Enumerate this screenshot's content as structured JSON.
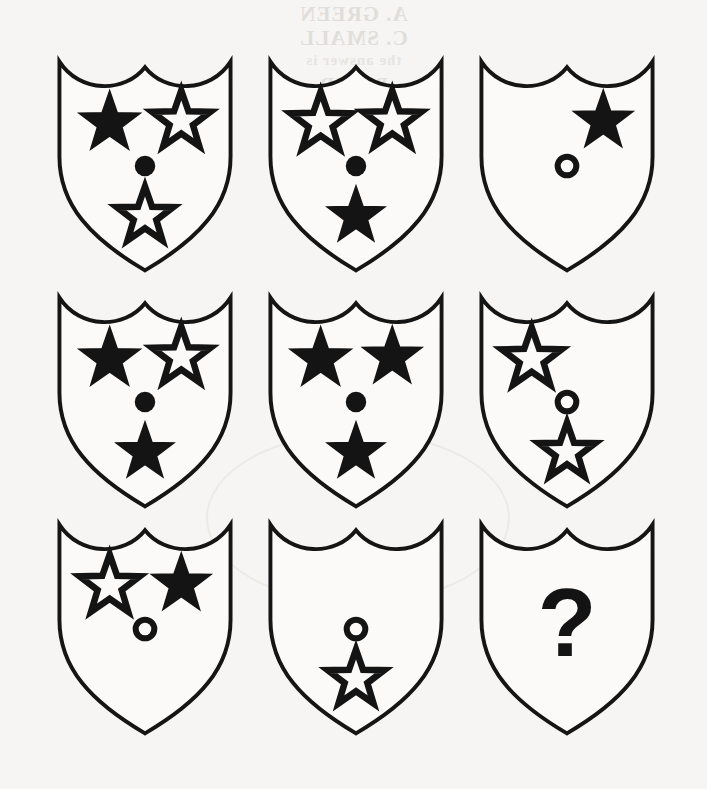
{
  "page": {
    "kind": "visual-analogy-matrix",
    "background_color": "#f6f5f3",
    "ink_color": "#141414",
    "rows": 3,
    "columns": 3
  },
  "bleed_through": {
    "note": "faint mirrored show-through text from the reverse side of the sheet",
    "line_1": "A. GREEN",
    "line_2": "C. SMALL",
    "line_3": "the answer is",
    "line_4": "B. RED"
  },
  "legend": {
    "filled_star": "filled-star",
    "outline_star": "outline-star",
    "filled_dot": "filled-dot",
    "outline_dot": "outline-dot",
    "empty": "none",
    "question": "?"
  },
  "cells": [
    {
      "index": 1,
      "name": "cell-r1c1",
      "row": 1,
      "column": 1,
      "x": 52,
      "y": 56,
      "width": 186,
      "height": 220,
      "top_left": "filled-star",
      "top_right": "outline-star",
      "center": "filled-dot",
      "bottom": "outline-star",
      "label": ""
    },
    {
      "index": 2,
      "name": "cell-r1c2",
      "row": 1,
      "column": 2,
      "x": 263,
      "y": 56,
      "width": 186,
      "height": 220,
      "top_left": "outline-star",
      "top_right": "outline-star",
      "center": "filled-dot",
      "bottom": "filled-star",
      "label": ""
    },
    {
      "index": 3,
      "name": "cell-r1c3",
      "row": 1,
      "column": 3,
      "x": 474,
      "y": 56,
      "width": 186,
      "height": 220,
      "top_left": "none",
      "top_right": "filled-star",
      "center": "outline-dot",
      "bottom": "none",
      "label": ""
    },
    {
      "index": 4,
      "name": "cell-r2c1",
      "row": 2,
      "column": 1,
      "x": 52,
      "y": 292,
      "width": 186,
      "height": 220,
      "top_left": "filled-star",
      "top_right": "outline-star",
      "center": "filled-dot",
      "bottom": "filled-star",
      "label": ""
    },
    {
      "index": 5,
      "name": "cell-r2c2",
      "row": 2,
      "column": 2,
      "x": 263,
      "y": 292,
      "width": 186,
      "height": 220,
      "top_left": "filled-star",
      "top_right": "filled-star",
      "center": "filled-dot",
      "bottom": "filled-star",
      "label": ""
    },
    {
      "index": 6,
      "name": "cell-r2c3",
      "row": 2,
      "column": 3,
      "x": 474,
      "y": 292,
      "width": 186,
      "height": 220,
      "top_left": "outline-star",
      "top_right": "none",
      "center": "outline-dot",
      "bottom": "outline-star",
      "label": ""
    },
    {
      "index": 7,
      "name": "cell-r3c1",
      "row": 3,
      "column": 1,
      "x": 52,
      "y": 519,
      "width": 186,
      "height": 220,
      "top_left": "outline-star",
      "top_right": "filled-star",
      "center": "outline-dot",
      "bottom": "none",
      "label": ""
    },
    {
      "index": 8,
      "name": "cell-r3c2",
      "row": 3,
      "column": 2,
      "x": 263,
      "y": 519,
      "width": 186,
      "height": 220,
      "top_left": "none",
      "top_right": "none",
      "center": "outline-dot",
      "bottom": "outline-star",
      "label": ""
    },
    {
      "index": 9,
      "name": "cell-r3c3-answer",
      "row": 3,
      "column": 3,
      "x": 474,
      "y": 519,
      "width": 186,
      "height": 220,
      "top_left": "none",
      "top_right": "none",
      "center": "none",
      "bottom": "none",
      "label": "?"
    }
  ]
}
